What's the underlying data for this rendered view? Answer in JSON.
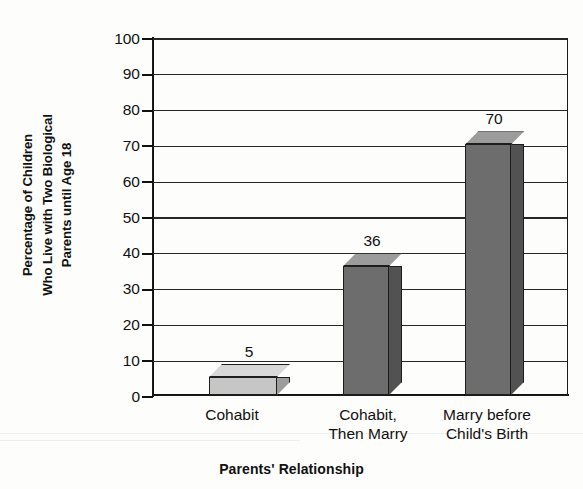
{
  "chart_data": {
    "type": "bar",
    "title": "",
    "categories": [
      "Cohabit",
      "Cohabit, Then Marry",
      "Marry before Child's Birth"
    ],
    "category_lines": [
      [
        "Cohabit"
      ],
      [
        "Cohabit,",
        "Then Marry"
      ],
      [
        "Marry before",
        "Child's Birth"
      ]
    ],
    "values": [
      5,
      36,
      70
    ],
    "value_labels": [
      "5",
      "36",
      "70"
    ],
    "xlabel": "Parents' Relationship",
    "ylabel": "Percentage of Children Who Live with Two Biological Parents until Age 18",
    "ylabel_lines": [
      "Percentage of Children",
      "Who Live with Two Biological",
      "Parents until Age 18"
    ],
    "ylim": [
      0,
      100
    ],
    "ytick_step": 10,
    "yticks": [
      0,
      10,
      20,
      30,
      40,
      50,
      60,
      70,
      80,
      90,
      100
    ],
    "ytick_labels": [
      "0",
      "10",
      "20",
      "30",
      "40",
      "50",
      "60",
      "70",
      "80",
      "90",
      "100"
    ],
    "grid": true,
    "legend": "none",
    "style": "3d-column",
    "bar_styles": [
      "light",
      "dark",
      "dark"
    ],
    "colors": {
      "bar_light_face": "#c6c6c6",
      "bar_light_side": "#9d9d9d",
      "bar_light_top": "#d8d8d8",
      "bar_dark_face": "#6d6d6d",
      "bar_dark_side": "#525252",
      "bar_dark_top": "#9c9c9c",
      "axis": "#111111",
      "gridline": "#272727",
      "text": "#111111",
      "background": "#fdfdfc"
    }
  }
}
